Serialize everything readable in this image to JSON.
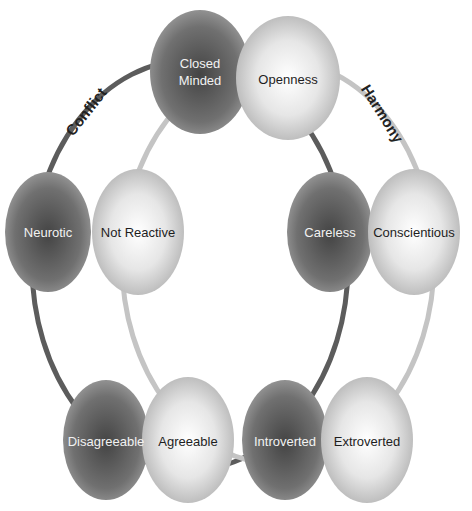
{
  "diagram": {
    "type": "two-ring trait diagram",
    "rings": [
      {
        "name": "Conflict",
        "label": "Conflict",
        "color": "#5a5a5a"
      },
      {
        "name": "Harmony",
        "label": "Harmony",
        "color": "#bdbdbd"
      }
    ],
    "pairs": [
      {
        "dark": {
          "label": "Closed\nMinded",
          "line1": "Closed",
          "line2": "Minded"
        },
        "light": {
          "label": "Openness"
        }
      },
      {
        "dark": {
          "label": "Neurotic"
        },
        "light": {
          "label": "Not Reactive"
        }
      },
      {
        "dark": {
          "label": "Careless"
        },
        "light": {
          "label": "Conscientious"
        }
      },
      {
        "dark": {
          "label": "Disagreeable"
        },
        "light": {
          "label": "Agreeable"
        }
      },
      {
        "dark": {
          "label": "Introverted"
        },
        "light": {
          "label": "Extroverted"
        }
      }
    ],
    "colors": {
      "dark_node_center": "#4a4a4a",
      "dark_node_edge": "#8a8a8a",
      "light_node_center": "#ffffff",
      "light_node_edge": "#b0b0b0"
    }
  }
}
